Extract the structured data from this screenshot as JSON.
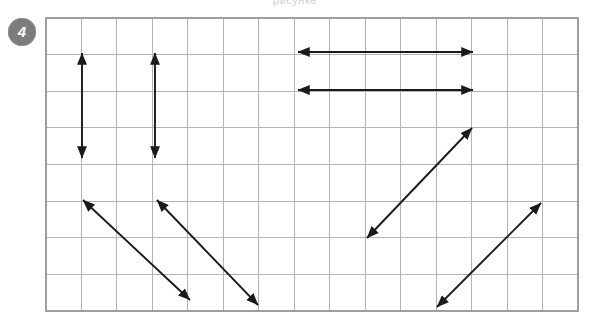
{
  "page": {
    "width": 590,
    "height": 322,
    "background_color": "#ffffff",
    "top_cropped_text": "рисунке"
  },
  "exercise": {
    "number": "4",
    "badge_fill_color": "#7d7d7d",
    "badge_text_color": "#ffffff"
  },
  "grid": {
    "columns": 15,
    "rows": 8,
    "left": 46,
    "top": 18,
    "right": 578,
    "bottom": 311,
    "cell_width": 35.47,
    "cell_height": 36.63,
    "line_color": "#b3b3b3",
    "border_color": "#9e9e9e"
  },
  "chart_data": {
    "type": "diagram",
    "xlabel": "",
    "ylabel": "",
    "grid": true,
    "legend": "none",
    "xlim": [
      0,
      15
    ],
    "ylim": [
      0,
      8
    ],
    "arrow_color": "#1a1a1a",
    "arrow_style": "double-headed",
    "arrow_count": 8,
    "arrows": [
      {
        "id": 1,
        "name": "vertical-arrow-left",
        "orientation": "vertical",
        "x1": 82,
        "y1": 53,
        "x2": 82,
        "y2": 158,
        "cells_x": 1,
        "cells_y": 3,
        "length_cells": 3
      },
      {
        "id": 2,
        "name": "vertical-arrow-second",
        "orientation": "vertical",
        "x1": 155,
        "y1": 53,
        "x2": 155,
        "y2": 158,
        "cells_x": 3,
        "cells_y": 3,
        "length_cells": 3
      },
      {
        "id": 3,
        "name": "horizontal-arrow-upper",
        "orientation": "horizontal",
        "x1": 298,
        "y1": 52,
        "x2": 473,
        "y2": 52,
        "cells_x": 5,
        "cells_y": 0,
        "length_cells": 5
      },
      {
        "id": 4,
        "name": "horizontal-arrow-lower",
        "orientation": "horizontal",
        "x1": 298,
        "y1": 90,
        "x2": 473,
        "y2": 90,
        "cells_x": 5,
        "cells_y": 0,
        "length_cells": 5
      },
      {
        "id": 5,
        "name": "diagonal-arrow-down-right-first",
        "orientation": "diagonal-down-right",
        "x1": 83,
        "y1": 200,
        "x2": 190,
        "y2": 300,
        "cells_x": 3,
        "cells_y": 3
      },
      {
        "id": 6,
        "name": "diagonal-arrow-down-right-second",
        "orientation": "diagonal-down-right",
        "x1": 157,
        "y1": 200,
        "x2": 258,
        "y2": 305,
        "cells_x": 3,
        "cells_y": 3
      },
      {
        "id": 7,
        "name": "diagonal-arrow-up-right-middle",
        "orientation": "diagonal-up-right",
        "x1": 367,
        "y1": 238,
        "x2": 472,
        "y2": 128,
        "cells_x": 3,
        "cells_y": 3
      },
      {
        "id": 8,
        "name": "diagonal-arrow-up-right-far",
        "orientation": "diagonal-up-right",
        "x1": 437,
        "y1": 307,
        "x2": 541,
        "y2": 203,
        "cells_x": 3,
        "cells_y": 3
      }
    ]
  }
}
